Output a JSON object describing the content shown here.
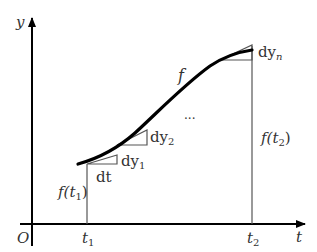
{
  "diagram": {
    "title": "",
    "axes": {
      "x_label": "t",
      "y_label": "y",
      "origin_label": "O"
    },
    "ticks": {
      "t1": "t",
      "t1_sub": "1",
      "t2": "t",
      "t2_sub": "2"
    },
    "curve_label": "f",
    "value_labels": {
      "f_t1": "f(t",
      "f_t1_sub": "1",
      "f_t1_close": ")",
      "f_t2": "f(t",
      "f_t2_sub": "2",
      "f_t2_close": ")"
    },
    "increments": {
      "dt": "dt",
      "dy1": "dy",
      "dy1_sub": "1",
      "dy2": "dy",
      "dy2_sub": "2",
      "dyn": "dy",
      "dyn_sub": "n",
      "ellipsis": "..."
    },
    "colors": {
      "axis": "#000000",
      "curve": "#000000",
      "guide": "#555555",
      "text": "#333333",
      "background": "#ffffff"
    }
  }
}
